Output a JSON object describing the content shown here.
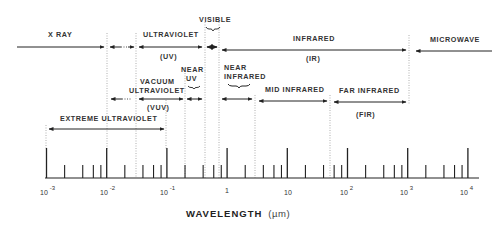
{
  "axis": {
    "title": "WAVELENGTH",
    "unit": "(µm)",
    "ticks": [
      {
        "base": "10",
        "exp": "-3",
        "value": 0.001
      },
      {
        "base": "10",
        "exp": "-2",
        "value": 0.01
      },
      {
        "base": "10",
        "exp": "-1",
        "value": 0.1
      },
      {
        "base": "1",
        "exp": "",
        "value": 1
      },
      {
        "base": "10",
        "exp": "",
        "value": 10
      },
      {
        "base": "10",
        "exp": "2",
        "value": 100
      },
      {
        "base": "10",
        "exp": "3",
        "value": 1000
      },
      {
        "base": "10",
        "exp": "4",
        "value": 10000
      }
    ],
    "scale": "log"
  },
  "regions": {
    "xray": {
      "label": "X RAY"
    },
    "ultraviolet": {
      "label": "ULTRAVIOLET",
      "abbr": "(UV)"
    },
    "visible": {
      "label": "VISIBLE"
    },
    "infrared": {
      "label": "INFRARED",
      "abbr": "(IR)"
    },
    "microwave": {
      "label": "MICROWAVE"
    },
    "near_uv": {
      "label1": "NEAR",
      "label2": "UV"
    },
    "vacuum_uv": {
      "label1": "VACUUM",
      "label2": "ULTRAVIOLET",
      "abbr": "(VUV)"
    },
    "near_ir": {
      "label1": "NEAR",
      "label2": "INFRARED"
    },
    "mid_ir": {
      "label": "MID INFRARED"
    },
    "far_ir": {
      "label": "FAR INFRARED",
      "abbr": "(FIR)"
    },
    "extreme_uv": {
      "label": "EXTREME ULTRAVIOLET"
    }
  },
  "colors": {
    "ink": "#222222",
    "dotted": "#999999",
    "background": "#ffffff"
  }
}
